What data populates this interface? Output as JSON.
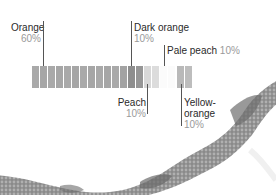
{
  "palette": [
    {
      "name": "Orange",
      "percent": "60%",
      "segments": 12,
      "color": "#a6a6a6"
    },
    {
      "name": "Dark orange",
      "percent": "10%",
      "segments": 2,
      "color": "#8e8e8e"
    },
    {
      "name": "Peach",
      "percent": "10%",
      "segments": 2,
      "color": "#d6d6d6"
    },
    {
      "name": "Pale peach",
      "percent": "10%",
      "segments": 2,
      "color": "#f4f4f4"
    },
    {
      "name": "Yellow-orange",
      "percent": "10%",
      "segments": 2,
      "color": "#b9b9b9"
    }
  ],
  "labels": {
    "orange": {
      "name": "Orange",
      "pct": "60%"
    },
    "dark_orange": {
      "name": "Dark orange",
      "pct": "10%"
    },
    "pale_peach": {
      "name": "Pale peach",
      "pct": "10%"
    },
    "peach": {
      "name": "Peach",
      "pct": "10%"
    },
    "yellow_orange_1": "Yellow-",
    "yellow_orange_2": "orange",
    "yellow_orange_pct": "10%"
  },
  "photo": {
    "subject": "beaded-rope"
  }
}
